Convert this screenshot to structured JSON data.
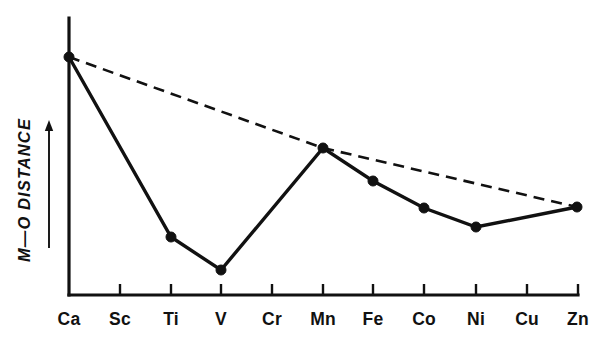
{
  "chart_data": {
    "type": "line",
    "title": "",
    "subtitle": "",
    "xlabel": "",
    "ylabel": "M—O DISTANCE",
    "ylabel_note": "axis direction arrow points up (increasing distance)",
    "categories": [
      "Ca",
      "Sc",
      "Ti",
      "V",
      "Cr",
      "Mn",
      "Fe",
      "Co",
      "Ni",
      "Cu",
      "Zn"
    ],
    "grid": false,
    "legend": "none",
    "axis_ranges": {
      "x": [
        "Ca",
        "Zn"
      ],
      "y": [
        0,
        1
      ]
    },
    "y_axis_ticks_labeled": false,
    "series": [
      {
        "name": "Observed M—O distance",
        "style": "solid",
        "marker": "filled-circle",
        "points": [
          {
            "x": "Ca",
            "y": 0.86,
            "has_marker": true
          },
          {
            "x": "Sc",
            "y": null,
            "has_marker": false
          },
          {
            "x": "Ti",
            "y": 0.21,
            "has_marker": true
          },
          {
            "x": "V",
            "y": 0.09,
            "has_marker": true
          },
          {
            "x": "Cr",
            "y": null,
            "has_marker": false
          },
          {
            "x": "Mn",
            "y": 0.53,
            "has_marker": true
          },
          {
            "x": "Fe",
            "y": 0.41,
            "has_marker": true
          },
          {
            "x": "Co",
            "y": 0.31,
            "has_marker": true
          },
          {
            "x": "Ni",
            "y": 0.25,
            "has_marker": true
          },
          {
            "x": "Cu",
            "y": null,
            "has_marker": false
          },
          {
            "x": "Zn",
            "y": 0.32,
            "has_marker": true
          }
        ]
      },
      {
        "name": "Reference (ideal) trend",
        "style": "dashed",
        "marker": "none",
        "points": [
          {
            "x": "Ca",
            "y": 0.86
          },
          {
            "x": "Mn",
            "y": 0.53
          },
          {
            "x": "Zn",
            "y": 0.32
          }
        ]
      }
    ],
    "pixel_geometry": {
      "note": "pixel coordinates measured from the source 610x350 raster",
      "axis_origin": {
        "x": 69,
        "y": 295
      },
      "y_axis_top": {
        "x": 69,
        "y": 18
      },
      "x_axis_right": {
        "x": 578,
        "y": 295
      },
      "tick_x_positions": [
        69,
        120,
        171,
        221,
        272,
        323,
        373,
        424,
        476,
        527,
        578
      ],
      "tick_height": 11,
      "label_baseline_y": 325,
      "marker_radius": 5,
      "solid_points": [
        {
          "x": 69,
          "y": 57
        },
        {
          "x": 171,
          "y": 237
        },
        {
          "x": 221,
          "y": 270
        },
        {
          "x": 323,
          "y": 148
        },
        {
          "x": 373,
          "y": 181
        },
        {
          "x": 424,
          "y": 208
        },
        {
          "x": 476,
          "y": 227
        },
        {
          "x": 577,
          "y": 207
        }
      ],
      "dashed_points": [
        {
          "x": 69,
          "y": 57
        },
        {
          "x": 323,
          "y": 148
        },
        {
          "x": 577,
          "y": 207
        }
      ],
      "ylabel_arrow": {
        "x": 49,
        "y_top": 120,
        "y_bottom": 248
      },
      "ylabel_text_anchor": {
        "x": 30,
        "y": 190
      }
    },
    "colors": {
      "line": "#111111",
      "marker": "#111111",
      "axis": "#111111",
      "background": "#ffffff",
      "text": "#111111"
    }
  }
}
